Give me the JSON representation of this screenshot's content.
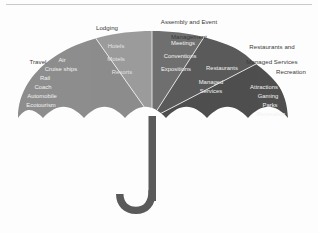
{
  "diagram": {
    "title_alt": "Hospitality Industry Umbrella",
    "type": "umbrella-segmented-diagram",
    "colors": {
      "travel": "#8d8d8d",
      "lodging": "#9c9c9c",
      "assembly": "#6f6f6f",
      "restaurants": "#5b5b5b",
      "recreation": "#4f4f4f",
      "handle": "#5a5a5a",
      "spoke": "#f4f4f4",
      "label_text": "#3a3a3a",
      "sub_text": "#f2f2f2",
      "background": "#fdfdfd",
      "rule": "#c9c9c9"
    }
  },
  "segments": [
    {
      "key": "travel",
      "label": "Travel",
      "items": [
        "Air",
        "Cruise ships",
        "Rail",
        "Coach",
        "Automobile",
        "Ecotourism"
      ]
    },
    {
      "key": "lodging",
      "label": "Lodging",
      "items": [
        "Hotels",
        "Motels",
        "Resorts"
      ]
    },
    {
      "key": "assembly",
      "label": "Assembly and Event\nManagement",
      "items": [
        "Meetings",
        "Conventions",
        "Expositions"
      ]
    },
    {
      "key": "restaurants",
      "label": "Restaurants and\nManaged Services",
      "items": [
        "Restaurants",
        "Managed\nServices"
      ]
    },
    {
      "key": "recreation",
      "label": "Recreation",
      "items": [
        "Attractions",
        "Gaming",
        "Parks",
        "Recreation"
      ]
    }
  ],
  "labels": {
    "travel": "Travel",
    "lodging": "Lodging",
    "assembly_line1": "Assembly and Event",
    "assembly_line2": "Management",
    "restaurants_line1": "Restaurants and",
    "restaurants_line2": "Managed Services",
    "recreation": "Recreation"
  },
  "sub_items": {
    "travel": {
      "air": "Air",
      "cruise_ships": "Cruise ships",
      "rail": "Rail",
      "coach": "Coach",
      "automobile": "Automobile",
      "ecotourism": "Ecotourism"
    },
    "lodging": {
      "hotels": "Hotels",
      "motels": "Motels",
      "resorts": "Resorts"
    },
    "assembly": {
      "meetings": "Meetings",
      "conventions": "Conventions",
      "expositions": "Expositions"
    },
    "restaurants": {
      "restaurants": "Restaurants",
      "managed": "Managed",
      "services": "Services"
    },
    "recreation": {
      "attractions": "Attractions",
      "gaming": "Gaming",
      "parks": "Parks",
      "recreation": "Recreation"
    }
  }
}
